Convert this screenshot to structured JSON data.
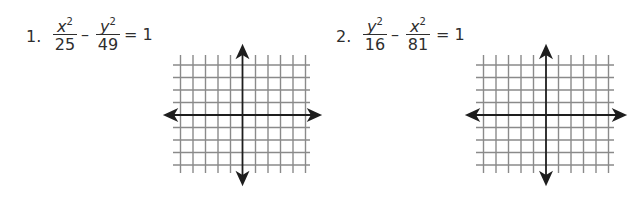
{
  "problems": [
    {
      "number": "1.",
      "term1": {
        "numerator_var": "x",
        "exponent": "2",
        "denominator": "25"
      },
      "operator": "–",
      "term2": {
        "numerator_var": "y",
        "exponent": "2",
        "denominator": "49"
      },
      "equals": "= 1",
      "graph": {
        "type": "coordinate-grid",
        "lines_each_side_x": 5,
        "lines_each_side_y": 4
      }
    },
    {
      "number": "2.",
      "term1": {
        "numerator_var": "y",
        "exponent": "2",
        "denominator": "16"
      },
      "operator": "–",
      "term2": {
        "numerator_var": "x",
        "exponent": "2",
        "denominator": "81"
      },
      "equals": "= 1",
      "graph": {
        "type": "coordinate-grid",
        "lines_each_side_x": 5,
        "lines_each_side_y": 4
      }
    }
  ],
  "colors": {
    "text": "#2e2e2e",
    "grid": "#8a8a8a",
    "axis": "#1e1e1e"
  }
}
